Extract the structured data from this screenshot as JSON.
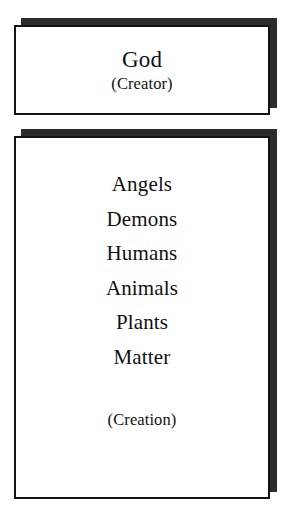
{
  "diagram": {
    "background_color": "#ffffff",
    "ink_color": "#131313",
    "shadow_color": "#2b2b2b",
    "creator_box": {
      "title": "God",
      "caption": "(Creator)"
    },
    "creation_box": {
      "items": [
        {
          "label": "Angels"
        },
        {
          "label": "Demons"
        },
        {
          "label": "Humans"
        },
        {
          "label": "Animals"
        },
        {
          "label": "Plants"
        },
        {
          "label": "Matter"
        }
      ],
      "caption": "(Creation)"
    }
  }
}
